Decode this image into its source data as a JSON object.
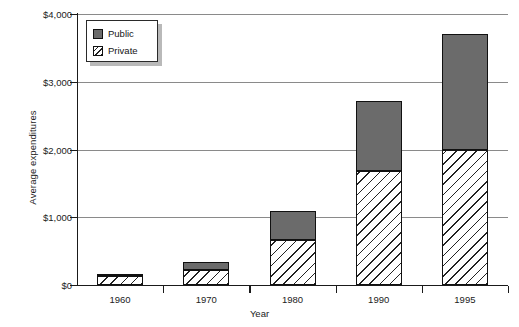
{
  "chart_data": {
    "type": "bar",
    "title": "",
    "xlabel": "Year",
    "ylabel": "Average expenditures",
    "categories": [
      "1960",
      "1970",
      "1980",
      "1990",
      "1995"
    ],
    "series": [
      {
        "name": "Private",
        "values": [
          130,
          220,
          660,
          1690,
          2000
        ]
      },
      {
        "name": "Public",
        "values": [
          30,
          120,
          430,
          1030,
          1700
        ]
      }
    ],
    "totals": [
      160,
      340,
      1090,
      2720,
      3700
    ],
    "stacked": true,
    "stack_order": [
      "Private",
      "Public"
    ],
    "ylim": [
      0,
      4000
    ],
    "yticks": [
      0,
      1000,
      2000,
      3000,
      4000
    ],
    "ytick_labels": [
      "$0",
      "$1,000",
      "$2,000",
      "$3,000",
      "$4,000"
    ],
    "grid": "horizontal",
    "legend_position": "upper-left-inside",
    "colors": {
      "public": "#6b6b6b",
      "private_hatch": "#222222",
      "private_background": "#ffffff",
      "gridline": "#8a8a8a",
      "axis": "#1a1a1a"
    }
  },
  "legend": {
    "items": [
      {
        "label": "Public",
        "key": "public"
      },
      {
        "label": "Private",
        "key": "private"
      }
    ]
  }
}
